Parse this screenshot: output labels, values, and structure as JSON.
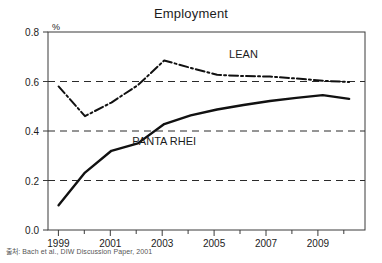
{
  "chart_data": {
    "type": "line",
    "title": "Employment",
    "xlabel": "",
    "ylabel": "%",
    "unit_label": "%",
    "xlim": [
      1998.6,
      2010.6
    ],
    "ylim": [
      0.0,
      0.8
    ],
    "grid": "horizontal-dashed",
    "legend_position": "inline-annotations",
    "y_ticks": [
      "0.0",
      "0.2",
      "0.4",
      "0.6",
      "0.8"
    ],
    "y_tick_values": [
      0.0,
      0.2,
      0.4,
      0.6,
      0.8
    ],
    "x_ticks": [
      "1999",
      "2001",
      "2003",
      "2005",
      "2007",
      "2009"
    ],
    "x_tick_values": [
      1999,
      2001,
      2003,
      2005,
      2007,
      2009
    ],
    "x_minor_tick_values": [
      2000,
      2002,
      2004,
      2006,
      2008,
      2010
    ],
    "x": [
      1999,
      2000,
      2001,
      2002,
      2003,
      2004,
      2005,
      2006,
      2007,
      2008,
      2009,
      2010
    ],
    "series": [
      {
        "name": "LEAN",
        "style": "dash-dot",
        "color": "#111111",
        "label": "LEAN",
        "values": [
          0.58,
          0.46,
          0.515,
          0.585,
          0.685,
          0.655,
          0.627,
          0.622,
          0.62,
          0.612,
          0.603,
          0.598
        ]
      },
      {
        "name": "PANTA RHEI",
        "style": "solid",
        "color": "#111111",
        "label": "PANTA RHEI",
        "values": [
          0.1,
          0.232,
          0.32,
          0.35,
          0.428,
          0.463,
          0.487,
          0.505,
          0.521,
          0.534,
          0.545,
          0.53
        ]
      }
    ],
    "annotations": [
      {
        "text": "LEAN",
        "x": 2006.0,
        "y": 0.695
      },
      {
        "text": "PANTA RHEI",
        "x": 2003.0,
        "y": 0.345
      }
    ],
    "source": "출처: Bach et al., DIW Discussion Paper, 2001"
  }
}
